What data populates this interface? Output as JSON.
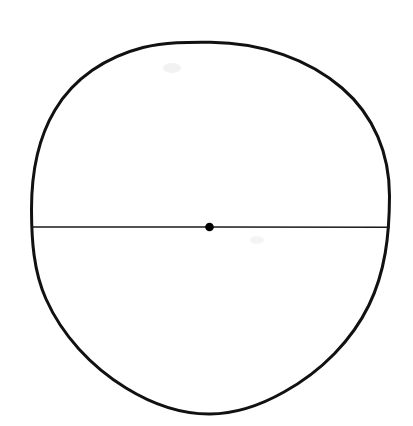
{
  "figure": {
    "kind": "geometry-diagram",
    "caption": "",
    "background_color": "#ffffff",
    "canvas": {
      "width": 413,
      "height": 426
    }
  },
  "chart_data": {
    "type": "diagram",
    "title": "",
    "subtitle": "",
    "xlabel": "",
    "ylabel": "",
    "grid": false,
    "legend": null,
    "annotations": [],
    "shapes": [
      {
        "name": "circle-outline",
        "type": "circle",
        "center": {
          "x": 210.5,
          "y": 228.0
        },
        "radius_x": 179.0,
        "radius_y": 186.0,
        "bounds": {
          "left": 31.5,
          "top": 42.0,
          "right": 389.5,
          "bottom": 414.0
        },
        "stroke_color": "#111111",
        "stroke_width": 3.0,
        "fill": "none",
        "hand_drawn": true
      },
      {
        "name": "diameter-line",
        "type": "line",
        "start": {
          "x": 32.5,
          "y": 227.0
        },
        "end": {
          "x": 389.0,
          "y": 227.2
        },
        "length": 356.5,
        "orientation": "horizontal",
        "stroke_color": "#1a1a1a",
        "stroke_width": 1.6,
        "hand_drawn": true
      },
      {
        "name": "center-point",
        "type": "dot",
        "center": {
          "x": 209.5,
          "y": 227.0
        },
        "radius": 4.3,
        "fill_color": "#000000",
        "stroke": "none"
      },
      {
        "name": "pencil-smudge-upper",
        "type": "smudge",
        "center": {
          "x": 172.0,
          "y": 68.0
        },
        "radius": 8.0,
        "fill_color": "#f2f2f2"
      },
      {
        "name": "pencil-smudge-lower",
        "type": "smudge",
        "center": {
          "x": 257.0,
          "y": 240.0
        },
        "radius": 6.0,
        "fill_color": "#f4f4f4"
      }
    ],
    "colors": {
      "ink": "#111111",
      "line_ink": "#1a1a1a",
      "dot": "#000000",
      "paper": "#ffffff"
    }
  }
}
